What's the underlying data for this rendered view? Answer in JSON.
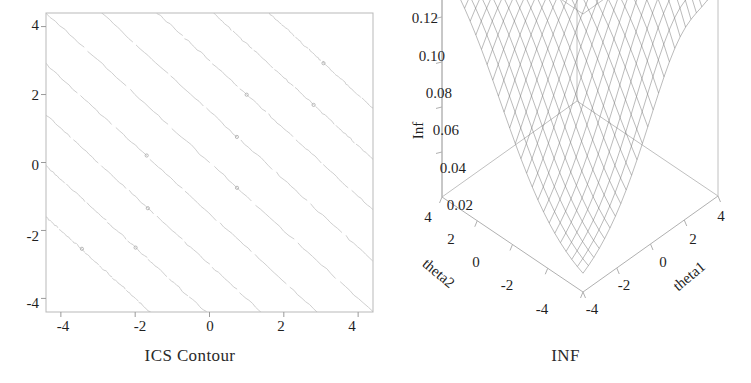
{
  "figure": {
    "background": "#ffffff",
    "panels": [
      {
        "name": "contour",
        "caption": "ICS Contour"
      },
      {
        "name": "surface",
        "caption": "INF"
      }
    ]
  },
  "contour_panel": {
    "caption": "ICS Contour",
    "x_ticks": [
      "-4",
      "-2",
      "0",
      "2",
      "4"
    ],
    "y_ticks": [
      "4",
      "2",
      "0",
      "-2",
      "-4"
    ],
    "frame_color": "#b9b9b9",
    "line_color": "#c9c9c9"
  },
  "surface_panel": {
    "caption": "INF",
    "z_axis_title": "Inf",
    "z_ticks": [
      "0.12",
      "0.10",
      "0.08",
      "0.06",
      "0.04",
      "0.02"
    ],
    "x_axis_title": "theta2",
    "x_ticks": [
      "4",
      "2",
      "0",
      "-2",
      "-4"
    ],
    "y_axis_title": "theta1",
    "y_ticks": [
      "-4",
      "-2",
      "0",
      "2",
      "4"
    ],
    "mesh_color": "#6d6d6d",
    "frame_color": "#c0c0c0"
  },
  "chart_data": [
    {
      "type": "line",
      "name": "ICS Contour",
      "title": "ICS Contour",
      "xlabel": "",
      "ylabel": "",
      "xlim": [
        -4.4,
        4.4
      ],
      "ylim": [
        -4.4,
        4.4
      ],
      "xticks": [
        -4,
        -2,
        0,
        2,
        4
      ],
      "yticks": [
        -4,
        -2,
        0,
        2,
        4
      ],
      "grid": false,
      "legend": "none",
      "description": "Contour plot of a function whose level sets are straight lines of slope -1; nine nearly-parallel diagonal contours running from upper-left to lower-right.",
      "contour_levels": [
        -6,
        -4.5,
        -3,
        -1.5,
        0,
        1.5,
        3,
        4.5,
        6
      ],
      "contour_slope": -1,
      "series": [
        {
          "name": "level -6.0",
          "intercept": -6.0,
          "slope": -1
        },
        {
          "name": "level -4.5",
          "intercept": -4.5,
          "slope": -1
        },
        {
          "name": "level -3.0",
          "intercept": -3.0,
          "slope": -1
        },
        {
          "name": "level -1.5",
          "intercept": -1.5,
          "slope": -1
        },
        {
          "name": "level 0.0",
          "intercept": 0.0,
          "slope": -1
        },
        {
          "name": "level 1.5",
          "intercept": 1.5,
          "slope": -1
        },
        {
          "name": "level 3.0",
          "intercept": 3.0,
          "slope": -1
        },
        {
          "name": "level 4.5",
          "intercept": 4.5,
          "slope": -1
        },
        {
          "name": "level 6.0",
          "intercept": 6.0,
          "slope": -1
        }
      ]
    },
    {
      "type": "surface",
      "name": "INF",
      "title": "INF",
      "xlabel": "theta2",
      "ylabel": "theta1",
      "zlabel": "Inf",
      "xlim": [
        -4,
        4
      ],
      "ylim": [
        -4,
        4
      ],
      "zlim": [
        0.0,
        0.12
      ],
      "xticks": [
        -4,
        -2,
        0,
        2,
        4
      ],
      "yticks": [
        -4,
        -2,
        0,
        2,
        4
      ],
      "zticks": [
        0.02,
        0.04,
        0.06,
        0.08,
        0.1,
        0.12
      ],
      "grid": true,
      "legend": "none",
      "description": "Wireframe mesh surface of information measure Inf over theta1 x theta2. Surface is flat/high (~0.11-0.12) along the back ridge and folds down steeply toward the front corner near theta1=-4, theta2=-4 where it approaches 0.",
      "mesh_nx": 26,
      "mesh_ny": 26
    }
  ]
}
